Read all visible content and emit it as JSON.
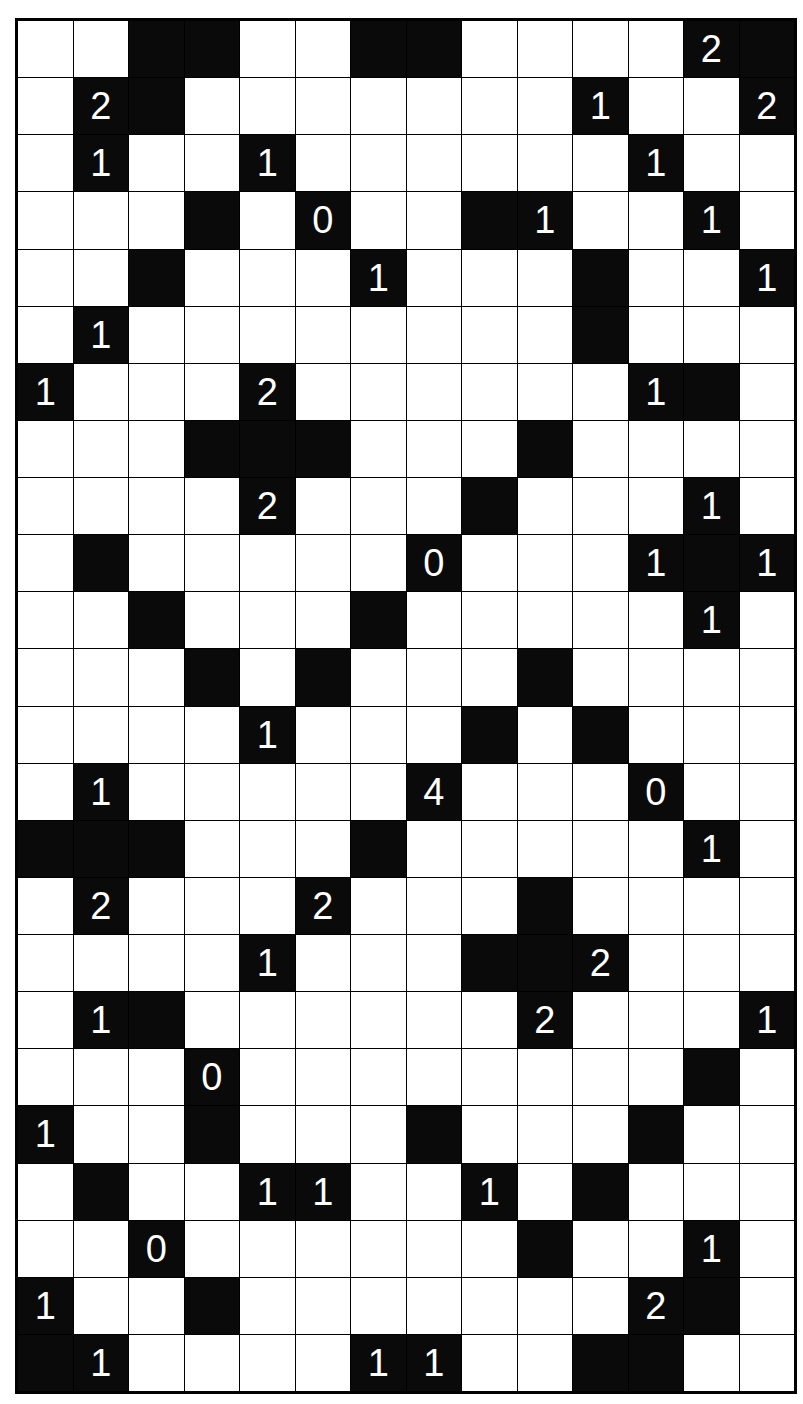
{
  "puzzle": {
    "type": "Light Up (Akari)",
    "columns": 14,
    "rows": 24,
    "legend": {
      ".": "white cell",
      "#": "black cell",
      "0-4": "numbered black cell"
    },
    "colors": {
      "white": "#ffffff",
      "black": "#0a0a0a",
      "number": "#ffffff"
    },
    "grid": [
      "..##..##....2#",
      ".2#.......1..2",
      ".1..1......1..",
      "...#.0..#1..1.",
      "..#...1...#..1",
      ".1........#...",
      "1...2......1#.",
      "...###...#....",
      "....2...#...1.",
      ".#.....0...1#1",
      "..#...#.....1.",
      "...#.#...#....",
      "....1...#.#...",
      ".1.....4...0..",
      "###...#.....1.",
      ".2...2...#....",
      "....1...##2...",
      ".1#......2...1",
      "...0........#.",
      "1..#...#...#..",
      ".#..11..1.#...",
      "..0......#..1.",
      "1..#.......2#.",
      "#1....11..##.."
    ]
  }
}
